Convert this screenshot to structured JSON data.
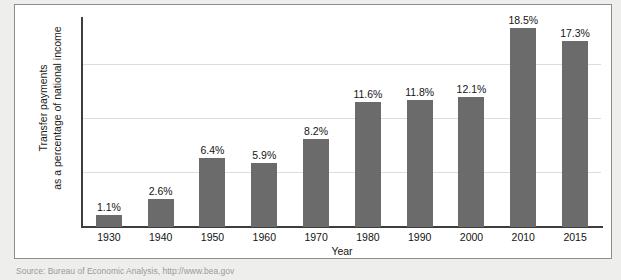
{
  "chart_data": {
    "type": "bar",
    "title": "",
    "xlabel": "Year",
    "ylabel": "Transfer payments as a percentage of national income",
    "ylabel_lines": [
      "Transfer payments",
      "as a percentage of national income"
    ],
    "categories": [
      "1930",
      "1940",
      "1950",
      "1960",
      "1970",
      "1980",
      "1990",
      "2000",
      "2010",
      "2015"
    ],
    "values": [
      1.1,
      2.6,
      6.4,
      5.9,
      8.2,
      11.6,
      11.8,
      12.1,
      18.5,
      17.3
    ],
    "value_labels": [
      "1.1%",
      "2.6%",
      "6.4%",
      "5.9%",
      "8.2%",
      "11.6%",
      "11.8%",
      "12.1%",
      "18.5%",
      "17.3%"
    ],
    "ylim": [
      0,
      19.3
    ],
    "gridlines": [
      5,
      10,
      15,
      20
    ],
    "grid": true,
    "legend": "none",
    "bar_color": "#6b6b6b",
    "grid_color": "#dcdcdc",
    "axis_color": "#3d3d3d"
  },
  "axes": {
    "x_title": "Year",
    "y_title_line1": "Transfer payments",
    "y_title_line2": "as a percentage of national income"
  },
  "footer": {
    "source": "Source: Bureau of Economic Analysis, http://www.bea.gov"
  }
}
